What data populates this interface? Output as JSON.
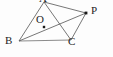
{
  "figure": {
    "kind": "euclidean-geometry-diagram",
    "canvas": {
      "width": 113,
      "height": 57
    },
    "background_color": "#fdfdfd",
    "stroke_color": "#4a4a4a",
    "base_stroke_color": "#8c8c8c",
    "dot_color": "#1a1a1a",
    "label_color": "#1e1e1e",
    "points": [
      {
        "id": "A",
        "label": "A",
        "x": 44,
        "y": 2,
        "has_dot": false,
        "label_x": 39,
        "label_y": -7,
        "clipped": true
      },
      {
        "id": "B",
        "label": "B",
        "x": 19,
        "y": 41,
        "has_dot": false,
        "label_x": 5,
        "label_y": 35
      },
      {
        "id": "C",
        "label": "C",
        "x": 71,
        "y": 40,
        "has_dot": false,
        "label_x": 68,
        "label_y": 36
      },
      {
        "id": "O",
        "label": "O",
        "x": 44,
        "y": 27,
        "has_dot": true,
        "label_x": 36,
        "label_y": 14
      },
      {
        "id": "P",
        "label": "P",
        "x": 86,
        "y": 13,
        "has_dot": true,
        "label_x": 91,
        "label_y": 5
      }
    ],
    "segments": [
      {
        "id": "AB",
        "from": "A",
        "to": "B",
        "style": "normal"
      },
      {
        "id": "AC",
        "from": "A",
        "to": "C",
        "style": "normal"
      },
      {
        "id": "BC",
        "from": "B",
        "to": "C",
        "style": "base"
      },
      {
        "id": "AP",
        "from": "A",
        "to": "P",
        "style": "normal"
      },
      {
        "id": "BP",
        "from": "B",
        "to": "P",
        "style": "normal"
      },
      {
        "id": "CP",
        "from": "C",
        "to": "P",
        "style": "normal"
      }
    ]
  }
}
